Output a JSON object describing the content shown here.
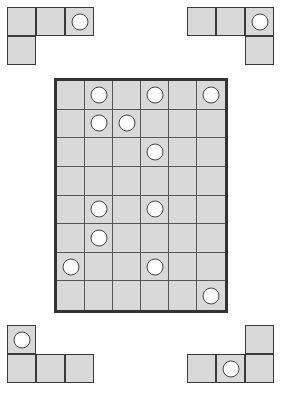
{
  "board": {
    "cols": 6,
    "rows": 8,
    "circles": [
      [
        0,
        1
      ],
      [
        0,
        3
      ],
      [
        0,
        5
      ],
      [
        1,
        1
      ],
      [
        1,
        2
      ],
      [
        2,
        3
      ],
      [
        4,
        1
      ],
      [
        4,
        3
      ],
      [
        5,
        1
      ],
      [
        6,
        0
      ],
      [
        6,
        3
      ],
      [
        7,
        5
      ]
    ]
  },
  "pieces": [
    {
      "name": "piece-top-left",
      "x": 7,
      "y": 7,
      "cells": [
        [
          0,
          0
        ],
        [
          0,
          1
        ],
        [
          0,
          2
        ],
        [
          1,
          0
        ]
      ],
      "circles": [
        [
          0,
          2
        ]
      ]
    },
    {
      "name": "piece-top-right",
      "x": 187,
      "y": 7,
      "cells": [
        [
          0,
          0
        ],
        [
          0,
          1
        ],
        [
          0,
          2
        ],
        [
          1,
          2
        ]
      ],
      "circles": [
        [
          0,
          2
        ]
      ]
    },
    {
      "name": "piece-bottom-left",
      "x": 7,
      "y": 325,
      "cells": [
        [
          0,
          0
        ],
        [
          1,
          0
        ],
        [
          1,
          1
        ],
        [
          1,
          2
        ]
      ],
      "circles": [
        [
          0,
          0
        ]
      ]
    },
    {
      "name": "piece-bottom-right",
      "x": 187,
      "y": 325,
      "cells": [
        [
          0,
          2
        ],
        [
          1,
          0
        ],
        [
          1,
          1
        ],
        [
          1,
          2
        ]
      ],
      "circles": [
        [
          1,
          1
        ]
      ]
    }
  ],
  "colors": {
    "cell_fill": "#d9d9d9",
    "grid_line": "#555555",
    "border": "#333333",
    "circle_fill": "#ffffff"
  }
}
